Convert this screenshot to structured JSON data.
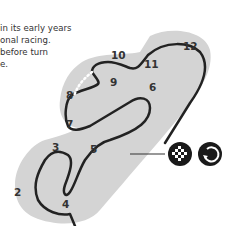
{
  "description": {
    "lines": [
      "in its early years",
      "onal racing.",
      "before turn",
      "e."
    ]
  },
  "track": {
    "turns": [
      "1",
      "2",
      "3",
      "4",
      "5",
      "6",
      "7",
      "8",
      "9",
      "10",
      "11",
      "12"
    ],
    "visible_turns": [
      "2",
      "3",
      "4",
      "5",
      "6",
      "7",
      "8",
      "9",
      "10",
      "11",
      "12"
    ],
    "colors": {
      "runoff": "#d4d4d4",
      "track": "#222222",
      "label": "#333333"
    }
  },
  "icons": [
    {
      "name": "checkered-flag-icon",
      "meaning": "start/finish"
    },
    {
      "name": "clockwise-direction-icon",
      "meaning": "race direction"
    }
  ]
}
